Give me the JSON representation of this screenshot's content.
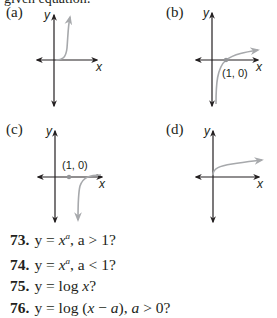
{
  "header": {
    "clipped_text": "given equation:"
  },
  "panels": [
    {
      "label": "(a)",
      "x_axis": "x",
      "y_axis": "y",
      "curve": "power, a > 1, rising steeply from origin"
    },
    {
      "label": "(b)",
      "x_axis": "x",
      "y_axis": "y",
      "point_label": "(1, 0)",
      "curve": "logarithmic, through (1, 0)"
    },
    {
      "label": "(c)",
      "x_axis": "x",
      "y_axis": "y",
      "point_label": "(1, 0)",
      "curve": "shifted log, vertical asymptote right of (1, 0)"
    },
    {
      "label": "(d)",
      "x_axis": "x",
      "y_axis": "y",
      "curve": "power, a < 1, concave down from origin"
    }
  ],
  "questions": [
    {
      "number": "73.",
      "text": "y = x^a, a > 1?",
      "lhs": "y = ",
      "base": "x",
      "exp": "a",
      "rest": ", a > 1?"
    },
    {
      "number": "74.",
      "text": "y = x^a, a < 1?",
      "lhs": "y = ",
      "base": "x",
      "exp": "a",
      "rest": ", a < 1?"
    },
    {
      "number": "75.",
      "text": "y = log x?",
      "lhs": "y = log ",
      "var": "x",
      "rest": "?"
    },
    {
      "number": "76.",
      "text": "y = log (x − a), a > 0?",
      "lhs": "y = log (",
      "var": "x",
      "mid": " − ",
      "var2": "a",
      "mid2": "), ",
      "var3": "a",
      "rest": " > 0?"
    }
  ],
  "colors": {
    "axis": "#231f20",
    "curve": "#a7a9ac",
    "point": "#939598"
  }
}
